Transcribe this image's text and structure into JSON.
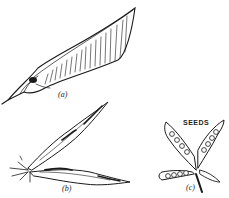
{
  "figure": {
    "panels": [
      {
        "id": "a",
        "label": "(a)",
        "description": "closed pea pod"
      },
      {
        "id": "b",
        "label": "(b)",
        "description": "pod splitting along seams, two twisted valves"
      },
      {
        "id": "c",
        "label": "(c)",
        "description": "opened pod showing seeds",
        "annotation": "SEEDS"
      }
    ]
  },
  "colors": {
    "ink": "#1a1a1a",
    "background": "#ffffff"
  }
}
